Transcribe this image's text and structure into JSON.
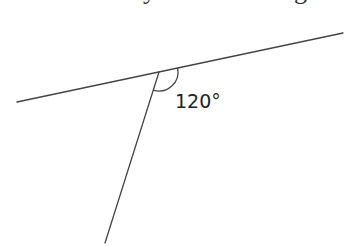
{
  "figure": {
    "type": "geometry-angle-diagram",
    "line_color": "#444444",
    "text_color": "#222222",
    "background": "#ffffff"
  },
  "top_text_fragments": {
    "left_fragment": "y",
    "right_fragment": "g"
  },
  "angle": {
    "value_degrees": 120,
    "label": "120°"
  }
}
